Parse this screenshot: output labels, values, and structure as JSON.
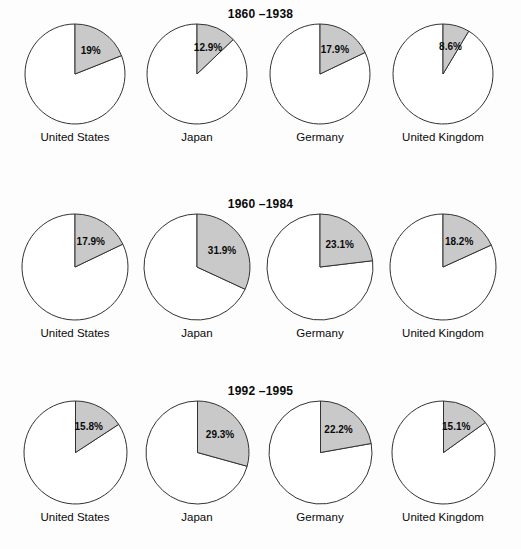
{
  "chart_data": {
    "type": "pie",
    "title": "",
    "subtitle": "",
    "xlabel": "",
    "ylabel": "",
    "legend_position": "none",
    "grid": false,
    "categories": [
      "United States",
      "Japan",
      "Germany",
      "United Kingdom"
    ],
    "panels": [
      {
        "title": "1860 –1938",
        "slices": [
          {
            "category": "United States",
            "value": 19.0,
            "label": "19%"
          },
          {
            "category": "Japan",
            "value": 12.9,
            "label": "12.9%"
          },
          {
            "category": "Germany",
            "value": 17.9,
            "label": "17.9%"
          },
          {
            "category": "United Kingdom",
            "value": 8.6,
            "label": "8.6%"
          }
        ]
      },
      {
        "title": "1960 –1984",
        "slices": [
          {
            "category": "United States",
            "value": 17.9,
            "label": "17.9%"
          },
          {
            "category": "Japan",
            "value": 31.9,
            "label": "31.9%"
          },
          {
            "category": "Germany",
            "value": 23.1,
            "label": "23.1%"
          },
          {
            "category": "United Kingdom",
            "value": 18.2,
            "label": "18.2%"
          }
        ]
      },
      {
        "title": "1992 –1995",
        "slices": [
          {
            "category": "United States",
            "value": 15.8,
            "label": "15.8%"
          },
          {
            "category": "Japan",
            "value": 29.3,
            "label": "29.3%"
          },
          {
            "category": "Germany",
            "value": 22.2,
            "label": "22.2%"
          },
          {
            "category": "United Kingdom",
            "value": 15.1,
            "label": "15.1%"
          }
        ]
      }
    ],
    "colors": {
      "slice_fill": "#c9c9c9",
      "remainder_fill": "#ffffff",
      "outline": "#333333",
      "background": "#fdfdfd",
      "text": "#0a0a0a"
    }
  },
  "layout": {
    "panel_tops": [
      6,
      196,
      383
    ],
    "pie_row_tops": [
      24,
      24,
      24
    ],
    "pie_diameters": [
      100,
      106,
      103
    ],
    "column_centers": [
      75,
      197,
      320,
      443
    ],
    "label_radius_factor": 0.56
  }
}
